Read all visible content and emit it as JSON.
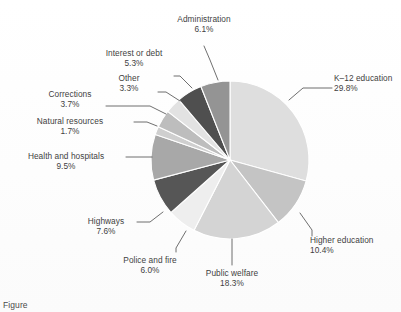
{
  "chart_data": {
    "type": "pie",
    "title": "",
    "subtitle": "",
    "xlabel": "",
    "ylabel": "",
    "legend_position": "none",
    "grid": false,
    "units": "percent",
    "start_angle_deg": 0,
    "direction": "clockwise",
    "categories": [
      "K–12 education",
      "Higher education",
      "Public welfare",
      "Police and fire",
      "Highways",
      "Health and hospitals",
      "Natural resources",
      "Corrections",
      "Other",
      "Interest or debt",
      "Administration"
    ],
    "values": [
      29.8,
      10.4,
      18.3,
      6.0,
      7.6,
      9.5,
      1.7,
      3.7,
      3.3,
      5.3,
      6.1
    ],
    "value_labels": [
      "29.8%",
      "10.4%",
      "18.3%",
      "6.0%",
      "7.6%",
      "9.5%",
      "1.7%",
      "3.7%",
      "3.3%",
      "5.3%",
      "6.1%"
    ],
    "slice_colors": [
      "#dedede",
      "#c4c4c4",
      "#d4d4d4",
      "#eeeeee",
      "#565656",
      "#a8a8a8",
      "#cfcfcf",
      "#bdbdbd",
      "#e2e2e2",
      "#4f4f4f",
      "#949494"
    ]
  },
  "slices": [
    {
      "name": "K–12 education",
      "pct": "29.8%",
      "color": "#dedede"
    },
    {
      "name": "Higher education",
      "pct": "10.4%",
      "color": "#c4c4c4"
    },
    {
      "name": "Public welfare",
      "pct": "18.3%",
      "color": "#d4d4d4"
    },
    {
      "name": "Police and fire",
      "pct": "6.0%",
      "color": "#eeeeee"
    },
    {
      "name": "Highways",
      "pct": "7.6%",
      "color": "#565656"
    },
    {
      "name": "Health and hospitals",
      "pct": "9.5%",
      "color": "#a8a8a8"
    },
    {
      "name": "Natural resources",
      "pct": "1.7%",
      "color": "#cfcfcf"
    },
    {
      "name": "Corrections",
      "pct": "3.7%",
      "color": "#bdbdbd"
    },
    {
      "name": "Other",
      "pct": "3.3%",
      "color": "#e2e2e2"
    },
    {
      "name": "Interest or debt",
      "pct": "5.3%",
      "color": "#4f4f4f"
    },
    {
      "name": "Administration",
      "pct": "6.1%",
      "color": "#949494"
    }
  ],
  "caption": {
    "text": "Figure"
  },
  "colors": {
    "background": "#ffffff",
    "text": "#3f3f3f",
    "leader_line": "#4a4a4a",
    "slice_edge": "#ffffff"
  }
}
